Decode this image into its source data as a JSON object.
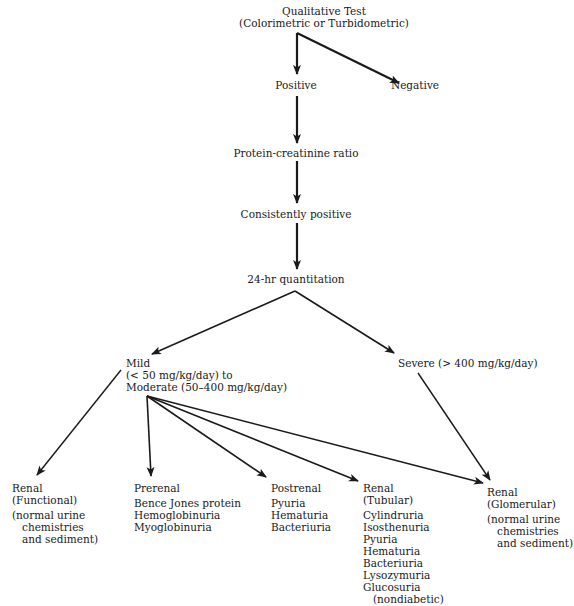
{
  "diagram": {
    "type": "flowchart",
    "nodes": {
      "qualitative": {
        "lines": [
          "Qualitative Test",
          "(Colorimetric or Turbidometric)"
        ]
      },
      "positive": {
        "label": "Positive"
      },
      "negative": {
        "label": "Negative"
      },
      "pcr": {
        "label": "Protein-creatinine ratio"
      },
      "consistently": {
        "label": "Consistently positive"
      },
      "quant24": {
        "label": "24-hr quantitation"
      },
      "mild": {
        "lines": [
          "Mild",
          "(< 50 mg/kg/day) to",
          "Moderate (50–400 mg/kg/day)"
        ]
      },
      "severe": {
        "label": "Severe (> 400 mg/kg/day)"
      },
      "renal_functional": {
        "title": "Renal",
        "subtitle": "(Functional)",
        "note": [
          "(normal urine",
          "chemistries",
          "and sediment)"
        ]
      },
      "prerenal": {
        "title": "Prerenal",
        "items": [
          "Bence Jones protein",
          "Hemoglobinuria",
          "Myoglobinuria"
        ]
      },
      "postrenal": {
        "title": "Postrenal",
        "items": [
          "Pyuria",
          "Hematuria",
          "Bacteriuria"
        ]
      },
      "renal_tubular": {
        "title": "Renal",
        "subtitle": "(Tubular)",
        "items": [
          "Cylindruria",
          "Isosthenuria",
          "Pyuria",
          "Hematuria",
          "Bacteriuria",
          "Lysozymuria",
          "Glucosuria"
        ],
        "item_note": "(nondiabetic)"
      },
      "renal_glomerular": {
        "title": "Renal",
        "subtitle": "(Glomerular)",
        "note": [
          "(normal urine",
          "chemistries",
          "and sediment)"
        ]
      }
    },
    "edges": [
      [
        "qualitative",
        "positive"
      ],
      [
        "qualitative",
        "negative"
      ],
      [
        "positive",
        "pcr"
      ],
      [
        "pcr",
        "consistently"
      ],
      [
        "consistently",
        "quant24"
      ],
      [
        "quant24",
        "mild"
      ],
      [
        "quant24",
        "severe"
      ],
      [
        "mild",
        "renal_functional"
      ],
      [
        "mild",
        "prerenal"
      ],
      [
        "mild",
        "postrenal"
      ],
      [
        "mild",
        "renal_tubular"
      ],
      [
        "mild",
        "renal_glomerular"
      ],
      [
        "severe",
        "renal_glomerular"
      ]
    ],
    "colors": {
      "ink": "#1a1a1a",
      "background": "#ffffff"
    }
  }
}
